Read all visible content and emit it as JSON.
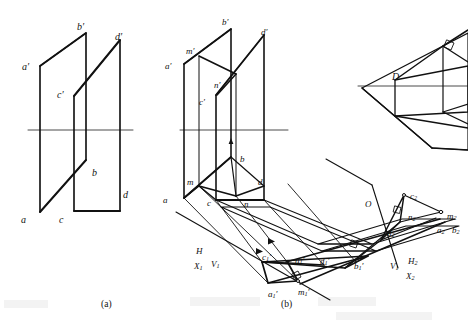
{
  "figure": {
    "ink_color": "#111111",
    "thin_color": "#555555",
    "background": "#ffffff",
    "captions": [
      {
        "id": "cap-a",
        "text": "(a)",
        "x": 101,
        "y": 300
      },
      {
        "id": "cap-b",
        "text": "(b)",
        "x": 281,
        "y": 300
      }
    ]
  },
  "panel_a": {
    "name": "pictorial-two-planes",
    "labels": [
      {
        "id": "a-bp",
        "text": "b",
        "prime": "′",
        "x": 77,
        "y": 22
      },
      {
        "id": "a-dp",
        "text": "d",
        "prime": "′",
        "x": 115,
        "y": 32
      },
      {
        "id": "a-ap",
        "text": "a",
        "prime": "′",
        "x": 22,
        "y": 62
      },
      {
        "id": "a-cp",
        "text": "c",
        "prime": "′",
        "x": 57,
        "y": 90
      },
      {
        "id": "a-b",
        "text": "b",
        "prime": "",
        "x": 92,
        "y": 168
      },
      {
        "id": "a-d",
        "text": "d",
        "prime": "",
        "x": 123,
        "y": 190
      },
      {
        "id": "a-a",
        "text": "a",
        "prime": "",
        "x": 21,
        "y": 215
      },
      {
        "id": "a-c",
        "text": "c",
        "prime": "",
        "x": 59,
        "y": 215
      }
    ]
  },
  "panel_b": {
    "name": "auxiliary-projection-construction",
    "labels": [
      {
        "id": "b-bp",
        "text": "b",
        "prime": "′",
        "sub": "",
        "x": 222,
        "y": 18
      },
      {
        "id": "b-dp",
        "text": "d",
        "prime": "′",
        "sub": "",
        "x": 261,
        "y": 28
      },
      {
        "id": "b-mp",
        "text": "m",
        "prime": "′",
        "sub": "",
        "x": 186,
        "y": 47
      },
      {
        "id": "b-ap",
        "text": "a",
        "prime": "′",
        "sub": "",
        "x": 165,
        "y": 62
      },
      {
        "id": "b-np",
        "text": "n",
        "prime": "′",
        "sub": "",
        "x": 214,
        "y": 81
      },
      {
        "id": "b-cp",
        "text": "c",
        "prime": "′",
        "sub": "",
        "x": 199,
        "y": 98
      },
      {
        "id": "b-b",
        "text": "b",
        "prime": "",
        "sub": "",
        "x": 240,
        "y": 155
      },
      {
        "id": "b-m",
        "text": "m",
        "prime": "",
        "sub": "",
        "x": 187,
        "y": 178
      },
      {
        "id": "b-d",
        "text": "d",
        "prime": "",
        "sub": "",
        "x": 258,
        "y": 178
      },
      {
        "id": "b-a",
        "text": "a",
        "prime": "",
        "sub": "",
        "x": 163,
        "y": 196
      },
      {
        "id": "b-c",
        "text": "c",
        "prime": "",
        "sub": "",
        "x": 207,
        "y": 199
      },
      {
        "id": "b-n",
        "text": "n",
        "prime": "",
        "sub": "",
        "x": 244,
        "y": 200
      },
      {
        "id": "b-H",
        "text": "H",
        "prime": "",
        "sub": "",
        "x": 196,
        "y": 247
      },
      {
        "id": "b-X1",
        "text": "X",
        "prime": "",
        "sub": "1",
        "x": 194,
        "y": 262
      },
      {
        "id": "b-V1",
        "text": "V",
        "prime": "",
        "sub": "1",
        "x": 211,
        "y": 260
      },
      {
        "id": "b-c1p",
        "text": "c",
        "prime": "′",
        "sub": "1",
        "x": 262,
        "y": 253
      },
      {
        "id": "b-n1p",
        "text": "n",
        "prime": "′",
        "sub": "1",
        "x": 295,
        "y": 256
      },
      {
        "id": "b-d1p",
        "text": "d",
        "prime": "′",
        "sub": "1",
        "x": 320,
        "y": 257
      },
      {
        "id": "b-b1p",
        "text": "b",
        "prime": "′",
        "sub": "1",
        "x": 354,
        "y": 262
      },
      {
        "id": "b-a1p",
        "text": "a",
        "prime": "′",
        "sub": "1",
        "x": 268,
        "y": 290
      },
      {
        "id": "b-m1p",
        "text": "m",
        "prime": "′",
        "sub": "1",
        "x": 298,
        "y": 288
      },
      {
        "id": "b-O",
        "text": "O",
        "prime": "",
        "sub": "",
        "x": 365,
        "y": 200
      },
      {
        "id": "b-c2",
        "text": "c",
        "prime": "",
        "sub": "2",
        "x": 410,
        "y": 192
      },
      {
        "id": "b-n2",
        "text": "n",
        "prime": "",
        "sub": "2",
        "x": 408,
        "y": 213
      },
      {
        "id": "b-d2",
        "text": "d",
        "prime": "",
        "sub": "2",
        "x": 387,
        "y": 229
      },
      {
        "id": "b-m2",
        "text": "m",
        "prime": "",
        "sub": "2",
        "x": 447,
        "y": 212
      },
      {
        "id": "b-a2",
        "text": "a",
        "prime": "",
        "sub": "2",
        "x": 437,
        "y": 226
      },
      {
        "id": "b-b2",
        "text": "b",
        "prime": "",
        "sub": "2",
        "x": 452,
        "y": 226
      },
      {
        "id": "b-V1b",
        "text": "V",
        "prime": "",
        "sub": "1",
        "x": 390,
        "y": 262
      },
      {
        "id": "b-H2",
        "text": "H",
        "prime": "",
        "sub": "2",
        "x": 408,
        "y": 257
      },
      {
        "id": "b-X2",
        "text": "X",
        "prime": "",
        "sub": "2",
        "x": 406,
        "y": 272
      }
    ]
  },
  "panel_c": {
    "name": "pictorial-dihedral-angle",
    "labels": [
      {
        "id": "c-D",
        "text": "D",
        "prime": "",
        "x": 392,
        "y": 72
      }
    ]
  }
}
